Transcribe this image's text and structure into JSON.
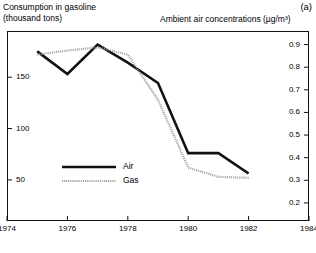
{
  "panel": {
    "label": "(a)"
  },
  "titles": {
    "left_axis_title": "Consumption in gasoline\n(thousand tons)",
    "right_axis_title": "Ambient air concentrations (µg/m³)"
  },
  "legend": {
    "entries": [
      {
        "label": "Air",
        "style": "solid",
        "color": "#111111"
      },
      {
        "label": "Gas",
        "style": "dotted",
        "color": "#9a9a9a"
      }
    ]
  },
  "axes": {
    "x": {
      "ticks": [
        "1974",
        "1976",
        "1978",
        "1980",
        "1982",
        "1984"
      ],
      "min": 1974,
      "max": 1984
    },
    "y_left": {
      "ticks": [
        "150",
        "100",
        "50"
      ],
      "tick_values": [
        150,
        100,
        50
      ],
      "min": 10,
      "max": 195
    },
    "y_right": {
      "ticks": [
        "0.9",
        "0.8",
        "0.7",
        "0.6",
        "0.5",
        "0.4",
        "0.3",
        "0.2"
      ],
      "tick_values": [
        0.9,
        0.8,
        0.7,
        0.6,
        0.5,
        0.4,
        0.3,
        0.2
      ],
      "min": 0.12,
      "max": 0.96
    }
  },
  "chart_data": {
    "type": "line",
    "title": "",
    "xlabel": "",
    "ylabel": "Consumption in gasoline (thousand tons)",
    "y2label": "Ambient air concentrations (µg/m³)",
    "xlim": [
      1974,
      1984
    ],
    "ylim": [
      10,
      195
    ],
    "y2lim": [
      0.12,
      0.96
    ],
    "grid": false,
    "legend_position": "center-left",
    "series": [
      {
        "name": "Air",
        "axis": "right",
        "units": "µg/m³",
        "style": "solid",
        "color": "#111111",
        "x": [
          1975,
          1976,
          1977,
          1978,
          1979,
          1980,
          1981,
          1982
        ],
        "values": [
          0.87,
          0.77,
          0.9,
          0.82,
          0.73,
          0.42,
          0.42,
          0.33
        ]
      },
      {
        "name": "Gas",
        "axis": "left",
        "units": "thousand tons",
        "style": "dotted",
        "color": "#9a9a9a",
        "x": [
          1975,
          1976,
          1977,
          1978,
          1979,
          1980,
          1981,
          1982
        ],
        "values": [
          172,
          176,
          179,
          172,
          128,
          62,
          53,
          52
        ]
      }
    ]
  }
}
